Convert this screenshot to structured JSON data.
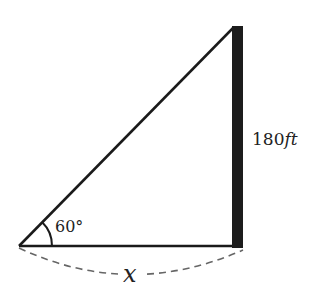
{
  "diagram": {
    "type": "right-triangle",
    "angle_label": "60°",
    "height_label_num": "180",
    "height_label_unit": "ft",
    "base_label": "x",
    "colors": {
      "line": "#1a1a1a",
      "pole": "#1c1c1c",
      "dash": "#666666",
      "text": "#222222"
    }
  }
}
